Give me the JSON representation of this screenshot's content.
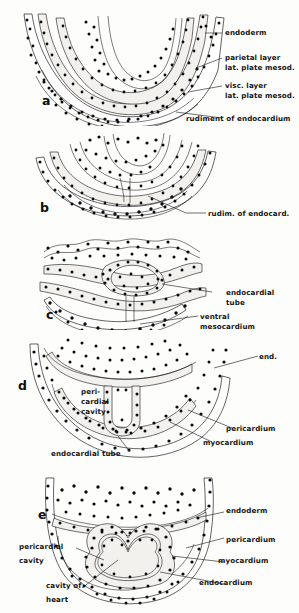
{
  "figure": {
    "type": "embryology-line-drawing",
    "background_color": "#fdfdfb",
    "ink_color": "#111111"
  },
  "panels": [
    {
      "letter": "a",
      "labels": [
        {
          "id": "endoderm",
          "text": "endoderm"
        },
        {
          "id": "parietal-1",
          "text": "parietal layer"
        },
        {
          "id": "parietal-2",
          "text": "lat. plate mesod."
        },
        {
          "id": "visc-1",
          "text": "visc. layer"
        },
        {
          "id": "visc-2",
          "text": "lat. plate  mesod."
        },
        {
          "id": "rudiment",
          "text": "rudiment of endocardium"
        }
      ]
    },
    {
      "letter": "b",
      "labels": [
        {
          "id": "rudim-endocard",
          "text": "rudim. of endocard."
        }
      ]
    },
    {
      "letter": "c",
      "labels": [
        {
          "id": "endocardial-tube-1",
          "text": "endocardial"
        },
        {
          "id": "endocardial-tube-2",
          "text": "tube"
        },
        {
          "id": "ventral-meso-1",
          "text": "ventral"
        },
        {
          "id": "ventral-meso-2",
          "text": "mesocardium"
        }
      ]
    },
    {
      "letter": "d",
      "labels": [
        {
          "id": "end",
          "text": "end."
        },
        {
          "id": "peri-cav-1",
          "text": "peri-"
        },
        {
          "id": "peri-cav-2",
          "text": "cardial"
        },
        {
          "id": "peri-cav-3",
          "text": "cavity"
        },
        {
          "id": "pericardium",
          "text": "pericardium"
        },
        {
          "id": "myocardium",
          "text": "myocardium"
        },
        {
          "id": "endocardial-tube",
          "text": "endocardial tube"
        }
      ]
    },
    {
      "letter": "e",
      "labels": [
        {
          "id": "endoderm",
          "text": "endoderm"
        },
        {
          "id": "pericardium",
          "text": "pericardium"
        },
        {
          "id": "myocardium",
          "text": "myocardium"
        },
        {
          "id": "endocardium",
          "text": "endocardium"
        },
        {
          "id": "peri-cav-1",
          "text": "pericardial"
        },
        {
          "id": "peri-cav-2",
          "text": "cavity"
        },
        {
          "id": "cavity-heart-1",
          "text": "cavity of"
        },
        {
          "id": "cavity-heart-2",
          "text": "heart"
        }
      ]
    }
  ]
}
